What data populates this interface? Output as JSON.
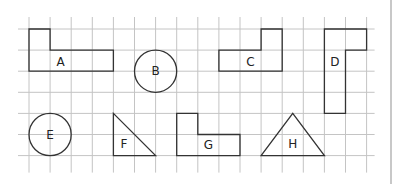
{
  "grid": {
    "origin_x": 29,
    "origin_y": 29,
    "cell": 21.1,
    "cols": 16,
    "rows": 6,
    "ext_left": 11,
    "ext_top": 12,
    "ext_right": 8,
    "ext_bottom": 17,
    "line_color": "#c4c4c4",
    "shape_color": "#333333"
  },
  "shapes": [
    {
      "label": "A",
      "type": "polygon",
      "points": [
        [
          0,
          0
        ],
        [
          1,
          0
        ],
        [
          1,
          1
        ],
        [
          4,
          1
        ],
        [
          4,
          2
        ],
        [
          0,
          2
        ]
      ],
      "label_pos": [
        1.5,
        1.55
      ]
    },
    {
      "label": "B",
      "type": "circle",
      "center": [
        6,
        2
      ],
      "r": 1,
      "label_pos": [
        6,
        2
      ]
    },
    {
      "label": "C",
      "type": "polygon",
      "points": [
        [
          11,
          0
        ],
        [
          12,
          0
        ],
        [
          12,
          2
        ],
        [
          9,
          2
        ],
        [
          9,
          1
        ],
        [
          11,
          1
        ]
      ],
      "label_pos": [
        10.5,
        1.55
      ]
    },
    {
      "label": "D",
      "type": "polygon",
      "points": [
        [
          14,
          0
        ],
        [
          16,
          0
        ],
        [
          16,
          1
        ],
        [
          15,
          1
        ],
        [
          15,
          4
        ],
        [
          14,
          4
        ]
      ],
      "label_pos": [
        14.5,
        1.55
      ]
    },
    {
      "label": "E",
      "type": "circle",
      "center": [
        1,
        5
      ],
      "r": 1,
      "label_pos": [
        1,
        5
      ]
    },
    {
      "label": "F",
      "type": "polygon",
      "points": [
        [
          4,
          4
        ],
        [
          6,
          6
        ],
        [
          4,
          6
        ]
      ],
      "label_pos": [
        4.5,
        5.45
      ]
    },
    {
      "label": "G",
      "type": "polygon",
      "points": [
        [
          7,
          4
        ],
        [
          8,
          4
        ],
        [
          8,
          5
        ],
        [
          10,
          5
        ],
        [
          10,
          6
        ],
        [
          7,
          6
        ]
      ],
      "label_pos": [
        8.5,
        5.5
      ]
    },
    {
      "label": "H",
      "type": "polygon",
      "points": [
        [
          12.5,
          4
        ],
        [
          14,
          6
        ],
        [
          11,
          6
        ]
      ],
      "label_pos": [
        12.5,
        5.45
      ]
    }
  ]
}
